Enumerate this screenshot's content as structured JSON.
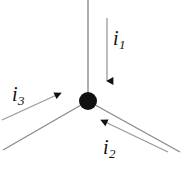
{
  "figure": {
    "type": "current-junction-diagram",
    "background_color": "#ffffff",
    "node": {
      "name": "junction-node",
      "center_x": 88,
      "center_y": 101,
      "radius": 9,
      "color": "#111111"
    },
    "branches": [
      {
        "name": "branch-top",
        "from_x": 88,
        "from_y": 0,
        "to_x": 88,
        "to_y": 101,
        "color": "#8c8c8c",
        "width": 1.4
      },
      {
        "name": "branch-lower-left",
        "from_x": 88,
        "from_y": 101,
        "to_x": 3,
        "to_y": 150,
        "color": "#8c8c8c",
        "width": 1.4
      },
      {
        "name": "branch-lower-right",
        "from_x": 88,
        "from_y": 101,
        "to_x": 180,
        "to_y": 152,
        "color": "#8c8c8c",
        "width": 1.4
      }
    ],
    "current_arrows": [
      {
        "name": "current-arrow-i1",
        "label": "i",
        "subscript": "1",
        "direction": "down",
        "tail_x": 107,
        "tail_y": 18,
        "head_x": 107,
        "head_y": 83,
        "color": "#9a9a9a",
        "head_color": "#111111"
      },
      {
        "name": "current-arrow-i2",
        "label": "i",
        "subscript": "2",
        "direction": "up-left",
        "tail_x": 168,
        "tail_y": 152,
        "head_x": 99,
        "head_y": 119,
        "color": "#9a9a9a",
        "head_color": "#111111"
      },
      {
        "name": "current-arrow-i3",
        "label": "i",
        "subscript": "3",
        "direction": "up-right",
        "tail_x": 2,
        "tail_y": 120,
        "head_x": 63,
        "head_y": 92,
        "color": "#9a9a9a",
        "head_color": "#111111"
      }
    ],
    "labels": {
      "i1": {
        "base": "i",
        "sub": "1"
      },
      "i2": {
        "base": "i",
        "sub": "2"
      },
      "i3": {
        "base": "i",
        "sub": "3"
      }
    }
  }
}
